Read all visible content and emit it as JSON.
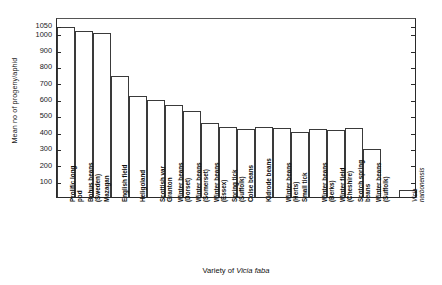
{
  "chart_data": {
    "type": "bar",
    "title": "",
    "xlabel": "Variety of Vicia faba",
    "xlabel_plain": "Variety of",
    "xlabel_italic": "Vicia faba",
    "ylabel": "Mean no of progeny/aphid",
    "ylim": [
      0,
      1100
    ],
    "grid": false,
    "legend": false,
    "yticks": [
      100,
      200,
      300,
      400,
      500,
      600,
      700,
      800,
      900,
      1000,
      1050
    ],
    "ytick_labels": [
      "100",
      "200",
      "300",
      "400",
      "500",
      "600",
      "700",
      "800",
      "900",
      "1000",
      "1050"
    ],
    "right_axis_ticks": true,
    "categories": [
      "Prolific long pod",
      "Bohus beans (Sweden)",
      "Mazagan",
      "English field",
      "Heligoland",
      "Scottish var Granton",
      "Winter beans (Dorset)",
      "Winter beans (Somerset)",
      "Winter beans (Essex)",
      "Spring tick (Suffolk)",
      "Colse beans",
      "Kidrode beans",
      "Winter beans (Herts)",
      "Small tick",
      "Winter beans (Berks)",
      "Winter field (Cheshire)",
      "Scotch spring beans",
      "Winter beans (Suffolk)",
      "Vicia narbonensis"
    ],
    "category_lines": [
      [
        "Prolific long",
        "pod"
      ],
      [
        "Bohus beans",
        "(Sweden)"
      ],
      [
        "Mazagan"
      ],
      [
        "English field"
      ],
      [
        "Heligoland"
      ],
      [
        "Scottish var",
        "Granton"
      ],
      [
        "Winter beans",
        "(Dorset)"
      ],
      [
        "Winter beans",
        "(Somerset)"
      ],
      [
        "Winter beans",
        "(Essex)"
      ],
      [
        "Spring tick",
        "(Suffolk)"
      ],
      [
        "Colse beans"
      ],
      [
        "Kidrode beans"
      ],
      [
        "Winter beans",
        "(Herts)"
      ],
      [
        "Small tick"
      ],
      [
        "Winter beans",
        "(Berks)"
      ],
      [
        "Winter field",
        "(Cheshire)"
      ],
      [
        "Scotch spring",
        "beans"
      ],
      [
        "Winter beans",
        "(Suffolk)"
      ],
      [
        "Vicia",
        "narbonensis"
      ]
    ],
    "values": [
      1040,
      1015,
      1000,
      740,
      620,
      595,
      560,
      525,
      450,
      425,
      415,
      425,
      420,
      400,
      415,
      410,
      420,
      295,
      45
    ],
    "gap_before_last": true
  }
}
